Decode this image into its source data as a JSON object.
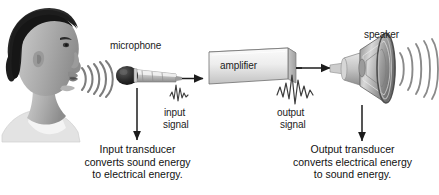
{
  "figure": {
    "background_color": "#ffffff",
    "ink_color": "#1c1c1c"
  },
  "labels": {
    "microphone": "microphone",
    "amplifier": "amplifier",
    "speaker": "speaker",
    "input_signal_line1": "input",
    "input_signal_line2": "signal",
    "output_signal_line1": "output",
    "output_signal_line2": "signal"
  },
  "captions": {
    "left": "Input transducer\nconverts sound energy\nto electrical energy.",
    "right": "Output transducer\nconverts electrical energy\nto sound energy."
  },
  "icons": {
    "head": "person-head-profile-icon",
    "mouth_sound_waves": "sound-wave-arcs-icon",
    "microphone": "microphone-icon",
    "input_waveform": "small-waveform-icon",
    "amplifier_box": "amplifier-box-icon",
    "output_waveform": "large-waveform-icon",
    "speaker": "loudspeaker-icon",
    "speaker_sound_waves": "sound-wave-arcs-icon",
    "signal_arrow_left": "right-arrow-icon",
    "signal_arrow_right": "right-arrow-icon",
    "pointer_arrow_mic": "down-arrow-icon",
    "pointer_arrow_speaker": "down-arrow-icon"
  },
  "colors": {
    "line": "#1c1c1c",
    "box_fill_light": "#f2f2f2",
    "box_fill_mid": "#d4d4d4",
    "box_stroke": "#6e6e6e",
    "hair_dark": "#232323",
    "skin_gray": "#a8a8a8",
    "skin_gray_light": "#c9c9c9",
    "wave_gray": "#9a9a9a",
    "speaker_gray": "#b5b5b5",
    "speaker_dark": "#6a6a6a"
  }
}
